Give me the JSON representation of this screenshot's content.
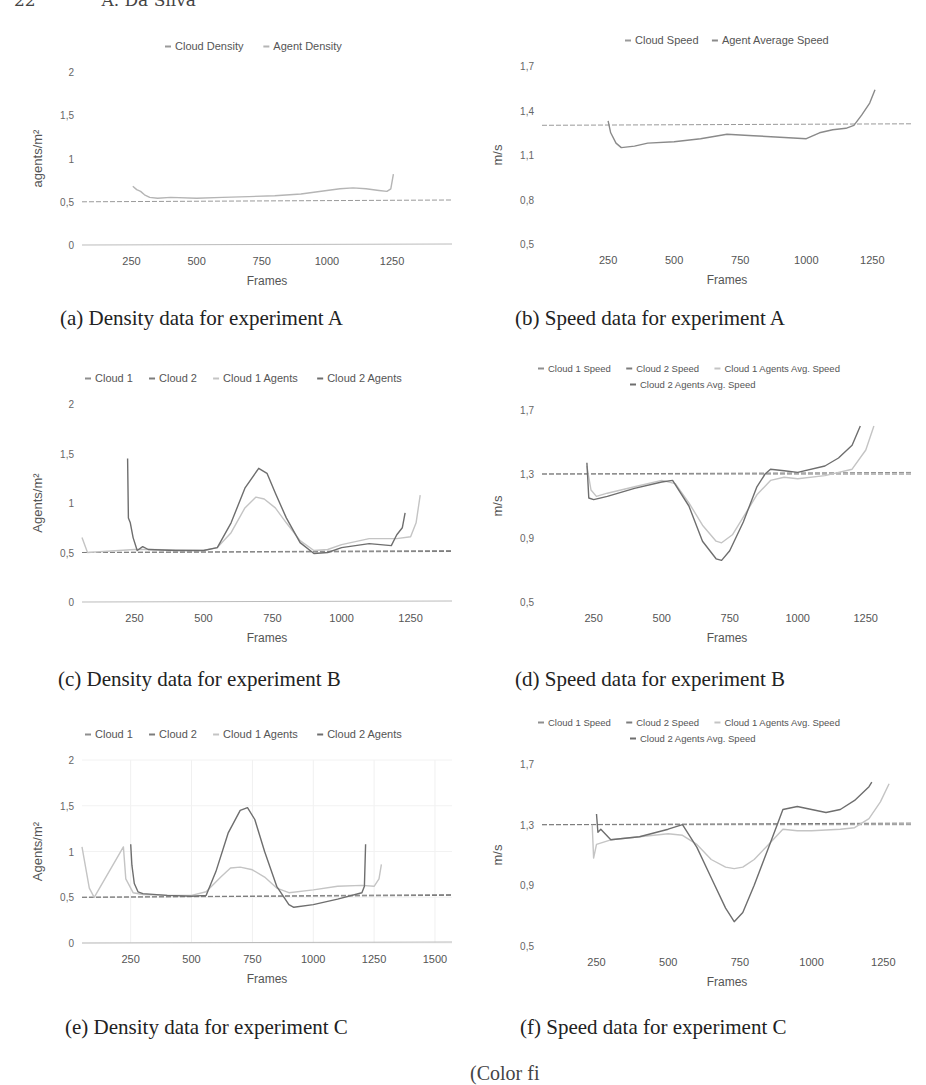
{
  "page": {
    "page_number": "22",
    "running_head": "A. Da Silva",
    "footer_partial": "(Color fi"
  },
  "captions": {
    "a": "(a) Density data for experiment A",
    "b": "(b) Speed data for experiment A",
    "c": "(c) Density data for experiment B",
    "d": "(d) Speed data for experiment B",
    "e": "(e) Density data for experiment C",
    "f": "(f) Speed data for experiment C"
  },
  "chart_data": [
    {
      "id": "a",
      "type": "line",
      "title": "",
      "caption": "(a) Density data for experiment A",
      "xlabel": "Frames",
      "ylabel": "agents/m²",
      "xticks": [
        "250",
        "500",
        "750",
        "1000",
        "1250"
      ],
      "yticks": [
        "0",
        "0,5",
        "1",
        "1,5",
        "2"
      ],
      "xlim": [
        60,
        1480
      ],
      "ylim": [
        0,
        2
      ],
      "grid": false,
      "legend_position": "top",
      "legend": [
        "Cloud Density",
        "Agent Density"
      ],
      "series": [
        {
          "name": "Cloud Density",
          "color": "#9a9a9a",
          "x": [
            60,
            1480
          ],
          "y": [
            0.5,
            0.52
          ]
        },
        {
          "name": "Agent Density",
          "color": "#b5b5b5",
          "x": [
            255,
            270,
            285,
            300,
            320,
            350,
            400,
            500,
            600,
            700,
            800,
            900,
            950,
            1000,
            1050,
            1100,
            1150,
            1200,
            1230,
            1245,
            1255
          ],
          "y": [
            0.68,
            0.64,
            0.62,
            0.58,
            0.55,
            0.54,
            0.55,
            0.54,
            0.55,
            0.56,
            0.57,
            0.59,
            0.61,
            0.63,
            0.65,
            0.66,
            0.65,
            0.63,
            0.62,
            0.65,
            0.82
          ]
        }
      ]
    },
    {
      "id": "b",
      "type": "line",
      "title": "",
      "caption": "(b) Speed data for experiment A",
      "xlabel": "Frames",
      "ylabel": "m/s",
      "xticks": [
        "250",
        "500",
        "750",
        "1000",
        "1250"
      ],
      "yticks": [
        "0,5",
        "0,8",
        "1,1",
        "1,4",
        "1,7"
      ],
      "xlim": [
        0,
        1400
      ],
      "ylim": [
        0.5,
        1.7
      ],
      "grid": false,
      "legend_position": "top",
      "legend": [
        "Cloud Speed",
        "Agent Average Speed"
      ],
      "series": [
        {
          "name": "Cloud Speed",
          "color": "#9a9a9a",
          "x": [
            0,
            1400
          ],
          "y": [
            1.3,
            1.31
          ]
        },
        {
          "name": "Agent Average Speed",
          "color": "#8a8a8a",
          "x": [
            250,
            260,
            280,
            300,
            350,
            400,
            500,
            600,
            700,
            800,
            900,
            1000,
            1050,
            1100,
            1150,
            1180,
            1210,
            1240,
            1260
          ],
          "y": [
            1.33,
            1.25,
            1.18,
            1.15,
            1.16,
            1.18,
            1.19,
            1.21,
            1.24,
            1.23,
            1.22,
            1.21,
            1.25,
            1.27,
            1.28,
            1.3,
            1.37,
            1.45,
            1.54
          ]
        }
      ]
    },
    {
      "id": "c",
      "type": "line",
      "title": "",
      "caption": "(c) Density data for experiment B",
      "xlabel": "Frames",
      "ylabel": "Agents/m²",
      "xticks": [
        "250",
        "500",
        "750",
        "1000",
        "1250"
      ],
      "yticks": [
        "0",
        "0,5",
        "1",
        "1,5",
        "2"
      ],
      "xlim": [
        60,
        1400
      ],
      "ylim": [
        0,
        2
      ],
      "grid": false,
      "legend_position": "top",
      "legend": [
        "Cloud 1",
        "Cloud 2",
        "Cloud 1 Agents",
        "Cloud 2 Agents"
      ],
      "series": [
        {
          "name": "Cloud 1",
          "color": "#8f8f8f",
          "x": [
            60,
            1400
          ],
          "y": [
            0.5,
            0.52
          ]
        },
        {
          "name": "Cloud 2",
          "color": "#7c7c7c",
          "x": [
            60,
            1400
          ],
          "y": [
            0.5,
            0.51
          ]
        },
        {
          "name": "Cloud 1 Agents",
          "color": "#c4c4c4",
          "x": [
            60,
            80,
            250,
            300,
            500,
            550,
            600,
            650,
            690,
            720,
            760,
            800,
            850,
            900,
            950,
            1000,
            1100,
            1200,
            1250,
            1270,
            1285
          ],
          "y": [
            0.65,
            0.5,
            0.53,
            0.53,
            0.52,
            0.55,
            0.7,
            0.95,
            1.06,
            1.04,
            0.95,
            0.8,
            0.62,
            0.52,
            0.53,
            0.58,
            0.64,
            0.64,
            0.66,
            0.8,
            1.08
          ]
        },
        {
          "name": "Cloud 2 Agents",
          "color": "#6e6e6e",
          "x": [
            225,
            228,
            235,
            245,
            260,
            280,
            300,
            400,
            500,
            550,
            600,
            650,
            700,
            730,
            760,
            800,
            850,
            900,
            950,
            1000,
            1100,
            1180,
            1200,
            1220,
            1230
          ],
          "y": [
            1.45,
            0.85,
            0.8,
            0.65,
            0.52,
            0.56,
            0.53,
            0.52,
            0.52,
            0.55,
            0.8,
            1.15,
            1.35,
            1.3,
            1.1,
            0.85,
            0.6,
            0.49,
            0.5,
            0.55,
            0.59,
            0.57,
            0.68,
            0.75,
            0.9
          ]
        }
      ]
    },
    {
      "id": "d",
      "type": "line",
      "title": "",
      "caption": "(d) Speed data for experiment B",
      "xlabel": "Frames",
      "ylabel": "m/s",
      "xticks": [
        "250",
        "500",
        "750",
        "1000",
        "1250"
      ],
      "yticks": [
        "0,5",
        "0,9",
        "1,3",
        "1,7"
      ],
      "xlim": [
        60,
        1420
      ],
      "ylim": [
        0.5,
        1.7
      ],
      "grid": false,
      "legend_position": "top",
      "legend": [
        "Cloud 1 Speed",
        "Cloud 2 Speed",
        "Cloud 1 Agents Avg. Speed",
        "Cloud 2 Agents Avg. Speed"
      ],
      "series": [
        {
          "name": "Cloud 1 Speed",
          "color": "#8f8f8f",
          "x": [
            60,
            1420
          ],
          "y": [
            1.3,
            1.31
          ]
        },
        {
          "name": "Cloud 2 Speed",
          "color": "#7c7c7c",
          "x": [
            60,
            1420
          ],
          "y": [
            1.3,
            1.3
          ]
        },
        {
          "name": "Cloud 1 Agents Avg. Speed",
          "color": "#c4c4c4",
          "x": [
            225,
            240,
            260,
            300,
            400,
            500,
            550,
            600,
            650,
            700,
            720,
            760,
            800,
            850,
            900,
            950,
            1000,
            1100,
            1200,
            1250,
            1280
          ],
          "y": [
            1.35,
            1.2,
            1.16,
            1.18,
            1.22,
            1.26,
            1.24,
            1.12,
            0.98,
            0.88,
            0.87,
            0.92,
            1.03,
            1.17,
            1.26,
            1.28,
            1.27,
            1.29,
            1.33,
            1.45,
            1.6
          ]
        },
        {
          "name": "Cloud 2 Agents Avg. Speed",
          "color": "#6e6e6e",
          "x": [
            225,
            232,
            250,
            300,
            400,
            500,
            540,
            600,
            650,
            700,
            720,
            750,
            800,
            850,
            880,
            900,
            950,
            1000,
            1100,
            1150,
            1200,
            1230
          ],
          "y": [
            1.37,
            1.15,
            1.14,
            1.16,
            1.21,
            1.25,
            1.26,
            1.1,
            0.88,
            0.77,
            0.76,
            0.82,
            1.0,
            1.22,
            1.3,
            1.33,
            1.32,
            1.31,
            1.35,
            1.4,
            1.48,
            1.6
          ]
        }
      ]
    },
    {
      "id": "e",
      "type": "line",
      "title": "",
      "caption": "(e) Density data for experiment C",
      "xlabel": "Frames",
      "ylabel": "Agents/m²",
      "xticks": [
        "250",
        "500",
        "750",
        "1000",
        "1250",
        "1500"
      ],
      "yticks": [
        "0",
        "0,5",
        "1",
        "1,5",
        "2"
      ],
      "xlim": [
        50,
        1570
      ],
      "ylim": [
        0,
        2
      ],
      "grid": true,
      "legend_position": "top",
      "legend": [
        "Cloud 1",
        "Cloud 2",
        "Cloud 1 Agents",
        "Cloud 2 Agents"
      ],
      "series": [
        {
          "name": "Cloud 1",
          "color": "#8f8f8f",
          "x": [
            50,
            1570
          ],
          "y": [
            0.5,
            0.53
          ]
        },
        {
          "name": "Cloud 2",
          "color": "#7c7c7c",
          "x": [
            50,
            1570
          ],
          "y": [
            0.5,
            0.52
          ]
        },
        {
          "name": "Cloud 1 Agents",
          "color": "#c4c4c4",
          "x": [
            50,
            80,
            100,
            220,
            230,
            260,
            300,
            400,
            500,
            560,
            620,
            660,
            700,
            750,
            800,
            850,
            900,
            1000,
            1100,
            1200,
            1250,
            1270,
            1280
          ],
          "y": [
            1.05,
            0.6,
            0.5,
            1.05,
            0.7,
            0.55,
            0.53,
            0.52,
            0.52,
            0.56,
            0.72,
            0.82,
            0.83,
            0.8,
            0.72,
            0.6,
            0.55,
            0.58,
            0.62,
            0.63,
            0.62,
            0.7,
            0.86
          ]
        },
        {
          "name": "Cloud 2 Agents",
          "color": "#6e6e6e",
          "x": [
            250,
            255,
            265,
            280,
            300,
            400,
            500,
            560,
            600,
            650,
            700,
            730,
            760,
            800,
            850,
            900,
            920,
            1000,
            1100,
            1200,
            1210,
            1215
          ],
          "y": [
            1.08,
            0.85,
            0.65,
            0.56,
            0.54,
            0.52,
            0.51,
            0.52,
            0.78,
            1.2,
            1.45,
            1.48,
            1.35,
            1.0,
            0.62,
            0.42,
            0.39,
            0.42,
            0.48,
            0.55,
            0.62,
            1.08
          ]
        }
      ]
    },
    {
      "id": "f",
      "type": "line",
      "title": "",
      "caption": "(f) Speed data for experiment C",
      "xlabel": "Frames",
      "ylabel": "m/s",
      "xticks": [
        "250",
        "500",
        "750",
        "1000",
        "1250"
      ],
      "yticks": [
        "0,5",
        "0,9",
        "1,3",
        "1,7"
      ],
      "xlim": [
        60,
        1350
      ],
      "ylim": [
        0.5,
        1.7
      ],
      "grid": false,
      "legend_position": "top",
      "legend": [
        "Cloud 1 Speed",
        "Cloud 2 Speed",
        "Cloud 1 Agents Avg. Speed",
        "Cloud 2 Agents Avg. Speed"
      ],
      "series": [
        {
          "name": "Cloud 1 Speed",
          "color": "#8f8f8f",
          "x": [
            60,
            1350
          ],
          "y": [
            1.3,
            1.3
          ]
        },
        {
          "name": "Cloud 2 Speed",
          "color": "#7c7c7c",
          "x": [
            60,
            1350
          ],
          "y": [
            1.3,
            1.31
          ]
        },
        {
          "name": "Cloud 1 Agents Avg. Speed",
          "color": "#c4c4c4",
          "x": [
            235,
            240,
            250,
            300,
            400,
            500,
            550,
            600,
            650,
            700,
            730,
            760,
            800,
            850,
            900,
            950,
            1000,
            1100,
            1150,
            1200,
            1240,
            1270
          ],
          "y": [
            1.3,
            1.08,
            1.17,
            1.2,
            1.22,
            1.24,
            1.23,
            1.17,
            1.07,
            1.02,
            1.01,
            1.02,
            1.07,
            1.17,
            1.27,
            1.26,
            1.26,
            1.27,
            1.28,
            1.34,
            1.45,
            1.57
          ]
        },
        {
          "name": "Cloud 2 Agents Avg. Speed",
          "color": "#6e6e6e",
          "x": [
            250,
            255,
            265,
            300,
            400,
            500,
            550,
            600,
            650,
            700,
            730,
            760,
            800,
            850,
            880,
            900,
            950,
            1000,
            1050,
            1100,
            1150,
            1200,
            1210
          ],
          "y": [
            1.37,
            1.25,
            1.27,
            1.2,
            1.22,
            1.27,
            1.3,
            1.15,
            0.95,
            0.75,
            0.66,
            0.72,
            0.9,
            1.15,
            1.3,
            1.4,
            1.42,
            1.4,
            1.38,
            1.4,
            1.46,
            1.55,
            1.58
          ]
        }
      ]
    }
  ]
}
